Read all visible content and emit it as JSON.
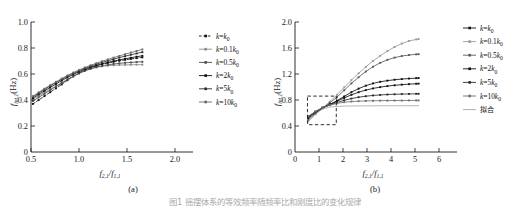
{
  "figure": {
    "caption": "图1  摇摆体系的等效频率随频率比和刚度比的变化规律",
    "panels": [
      {
        "id": "a",
        "label": "(a)",
        "xlabel_main": "f",
        "xlabel_sub1": "2,1",
        "xlabel_div": "/f",
        "xlabel_sub2": "1,1",
        "ylabel_main": "f",
        "ylabel_sub": "int,1",
        "ylabel_unit": "(Hz)",
        "xticks": [
          "0.5",
          "1.0",
          "1.5",
          "2.0"
        ],
        "yticks": [
          "0",
          "0.2",
          "0.4",
          "0.6",
          "0.8",
          "1.0"
        ],
        "legend": [
          {
            "label_pre": "k",
            "label_eq": "=",
            "label_post": "k",
            "label_sub": "0",
            "coef": "",
            "dashed": true,
            "color": "#111111"
          },
          {
            "label_pre": "k",
            "label_eq": "=",
            "label_post": "k",
            "label_sub": "0",
            "coef": "0.1",
            "dashed": false,
            "color": "#8c8c8c"
          },
          {
            "label_pre": "k",
            "label_eq": "=",
            "label_post": "k",
            "label_sub": "0",
            "coef": "0.5",
            "dashed": false,
            "color": "#4d4d4d"
          },
          {
            "label_pre": "k",
            "label_eq": "=",
            "label_post": "k",
            "label_sub": "0",
            "coef": "2",
            "dashed": false,
            "color": "#111111"
          },
          {
            "label_pre": "k",
            "label_eq": "=",
            "label_post": "k",
            "label_sub": "0",
            "coef": "5",
            "dashed": false,
            "color": "#2b2b2b"
          },
          {
            "label_pre": "k",
            "label_eq": "=",
            "label_post": "k",
            "label_sub": "0",
            "coef": "10",
            "dashed": false,
            "color": "#6b6b6b"
          }
        ]
      },
      {
        "id": "b",
        "label": "(b)",
        "xlabel_main": "f",
        "xlabel_sub1": "2,1",
        "xlabel_div": "/f",
        "xlabel_sub2": "1,1",
        "ylabel_main": "f",
        "ylabel_sub": "int,1",
        "ylabel_unit": "(Hz)",
        "xticks": [
          "0",
          "1",
          "2",
          "3",
          "4",
          "5",
          "6"
        ],
        "yticks": [
          "0",
          "0.4",
          "0.8",
          "1.2",
          "1.6",
          "2.0"
        ],
        "legend": [
          {
            "label_pre": "k",
            "label_eq": "=",
            "label_post": "k",
            "label_sub": "0",
            "coef": "",
            "dashed": false,
            "color": "#111111"
          },
          {
            "label_pre": "k",
            "label_eq": "=",
            "label_post": "k",
            "label_sub": "0",
            "coef": "0.1",
            "dashed": false,
            "color": "#9a9a9a"
          },
          {
            "label_pre": "k",
            "label_eq": "=",
            "label_post": "k",
            "label_sub": "0",
            "coef": "0.5",
            "dashed": false,
            "color": "#5a5a5a"
          },
          {
            "label_pre": "k",
            "label_eq": "=",
            "label_post": "k",
            "label_sub": "0",
            "coef": "2",
            "dashed": false,
            "color": "#111111"
          },
          {
            "label_pre": "k",
            "label_eq": "=",
            "label_post": "k",
            "label_sub": "0",
            "coef": "5",
            "dashed": false,
            "color": "#2b2b2b"
          },
          {
            "label_pre": "k",
            "label_eq": "=",
            "label_post": "k",
            "label_sub": "0",
            "coef": "10",
            "dashed": false,
            "color": "#707070"
          },
          {
            "label_cn": "拟合",
            "dashed": false,
            "color": "#a8a8a8",
            "nomarker": true
          }
        ]
      }
    ]
  },
  "chart_data": [
    {
      "type": "line",
      "panel": "(a)",
      "title": "",
      "xlabel": "f_2,1/f_1,1",
      "ylabel": "f_int,1 (Hz)",
      "xlim": [
        0.5,
        2.0
      ],
      "ylim": [
        0.0,
        1.0
      ],
      "xticks": [
        0.5,
        1.0,
        1.5,
        2.0
      ],
      "yticks": [
        0.0,
        0.2,
        0.4,
        0.6,
        0.8,
        1.0
      ],
      "grid": false,
      "legend_position": "right-outside",
      "x": [
        0.52,
        0.58,
        0.64,
        0.7,
        0.76,
        0.82,
        0.88,
        0.94,
        1.0,
        1.06,
        1.12,
        1.18,
        1.24,
        1.3,
        1.36,
        1.42,
        1.48,
        1.54,
        1.6,
        1.66
      ],
      "series": [
        {
          "name": "k=k0",
          "values": [
            0.37,
            0.4,
            0.43,
            0.46,
            0.49,
            0.52,
            0.552,
            0.582,
            0.608,
            0.63,
            0.648,
            0.663,
            0.675,
            0.685,
            0.694,
            0.702,
            0.709,
            0.716,
            0.722,
            0.728
          ]
        },
        {
          "name": "k=0.1k0",
          "values": [
            0.405,
            0.432,
            0.458,
            0.483,
            0.508,
            0.533,
            0.558,
            0.583,
            0.605,
            0.624,
            0.639,
            0.651,
            0.659,
            0.664,
            0.667,
            0.669,
            0.67,
            0.671,
            0.672,
            0.672
          ]
        },
        {
          "name": "k=0.5k0",
          "values": [
            0.392,
            0.42,
            0.448,
            0.476,
            0.503,
            0.53,
            0.557,
            0.582,
            0.604,
            0.624,
            0.64,
            0.653,
            0.663,
            0.671,
            0.677,
            0.682,
            0.686,
            0.689,
            0.692,
            0.694
          ]
        },
        {
          "name": "k=2k0",
          "values": [
            0.414,
            0.443,
            0.47,
            0.497,
            0.523,
            0.549,
            0.574,
            0.597,
            0.617,
            0.636,
            0.652,
            0.666,
            0.678,
            0.689,
            0.699,
            0.708,
            0.717,
            0.725,
            0.733,
            0.74
          ]
        },
        {
          "name": "k=5k0",
          "values": [
            0.424,
            0.453,
            0.481,
            0.508,
            0.534,
            0.559,
            0.583,
            0.605,
            0.625,
            0.643,
            0.66,
            0.675,
            0.689,
            0.702,
            0.714,
            0.726,
            0.737,
            0.748,
            0.758,
            0.768
          ]
        },
        {
          "name": "k=10k0",
          "values": [
            0.43,
            0.459,
            0.487,
            0.514,
            0.54,
            0.565,
            0.589,
            0.611,
            0.631,
            0.65,
            0.667,
            0.683,
            0.698,
            0.712,
            0.726,
            0.739,
            0.752,
            0.765,
            0.777,
            0.789
          ]
        }
      ]
    },
    {
      "type": "line",
      "panel": "(b)",
      "title": "",
      "xlabel": "f_2,1/f_1,1",
      "ylabel": "f_int,1 (Hz)",
      "xlim": [
        0,
        6
      ],
      "ylim": [
        0.0,
        2.0
      ],
      "xticks": [
        0,
        1,
        2,
        3,
        4,
        5,
        6
      ],
      "yticks": [
        0.0,
        0.4,
        0.8,
        1.2,
        1.6,
        2.0
      ],
      "grid": false,
      "legend_position": "right-outside",
      "inset_box": {
        "x0": 0.52,
        "x1": 1.72,
        "y0": 0.42,
        "y1": 0.86
      },
      "x": [
        0.55,
        0.85,
        1.15,
        1.45,
        1.75,
        2.05,
        2.35,
        2.65,
        2.95,
        3.25,
        3.55,
        3.85,
        4.15,
        4.45,
        4.75,
        5.05,
        5.15
      ],
      "series": [
        {
          "name": "k=k0",
          "values": [
            0.52,
            0.6,
            0.672,
            0.73,
            0.79,
            0.855,
            0.92,
            0.975,
            1.02,
            1.055,
            1.08,
            1.098,
            1.112,
            1.122,
            1.13,
            1.136,
            1.138
          ]
        },
        {
          "name": "k=0.1k0",
          "values": [
            0.47,
            0.585,
            0.68,
            0.775,
            0.88,
            0.995,
            1.105,
            1.21,
            1.31,
            1.4,
            1.48,
            1.552,
            1.615,
            1.668,
            1.708,
            1.732,
            1.738
          ]
        },
        {
          "name": "k=0.5k0",
          "values": [
            0.495,
            0.59,
            0.676,
            0.755,
            0.845,
            0.95,
            1.055,
            1.15,
            1.238,
            1.312,
            1.372,
            1.418,
            1.452,
            1.476,
            1.492,
            1.502,
            1.505
          ]
        },
        {
          "name": "k=2k0",
          "values": [
            0.535,
            0.612,
            0.68,
            0.732,
            0.782,
            0.832,
            0.88,
            0.92,
            0.952,
            0.978,
            0.998,
            1.014,
            1.026,
            1.036,
            1.044,
            1.05,
            1.052
          ]
        },
        {
          "name": "k=5k0",
          "values": [
            0.545,
            0.62,
            0.682,
            0.725,
            0.762,
            0.795,
            0.822,
            0.843,
            0.858,
            0.87,
            0.878,
            0.884,
            0.888,
            0.891,
            0.893,
            0.895,
            0.895
          ]
        },
        {
          "name": "k=10k0",
          "values": [
            0.548,
            0.624,
            0.684,
            0.72,
            0.748,
            0.766,
            0.776,
            0.782,
            0.786,
            0.788,
            0.79,
            0.791,
            0.792,
            0.792,
            0.793,
            0.793,
            0.793
          ]
        },
        {
          "name": "拟合",
          "values": [
            0.47,
            0.582,
            0.662,
            0.692,
            0.702,
            0.706,
            0.708,
            0.709,
            0.71,
            0.71,
            0.711,
            0.711,
            0.711,
            0.712,
            0.712,
            0.712,
            0.712
          ]
        }
      ]
    }
  ]
}
